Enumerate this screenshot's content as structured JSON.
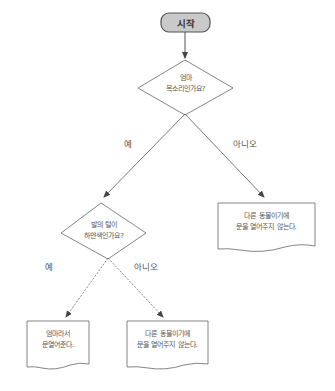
{
  "flowchart": {
    "start": {
      "label": "시작"
    },
    "decision1": {
      "line1": "엄마",
      "line2": "목소리인가요?"
    },
    "decision1_yes": "예",
    "decision1_no": "아니오",
    "outcome_no1": {
      "line1": "다른 동물이기에",
      "line2": "문을 열어주지 않는다."
    },
    "decision2": {
      "line1": "발의 털이",
      "line2": "하얀색인가요?"
    },
    "decision2_yes": "예",
    "decision2_no": "아니오",
    "outcome_yes2": {
      "line1": "엄마라서",
      "line2": "문열어준다."
    },
    "outcome_no2": {
      "line1": "다른 동물이기에",
      "line2": "문을 열어주지 않는다."
    }
  },
  "colors": {
    "start_fill": "#c9c9c9",
    "start_border": "#555555",
    "line": "#555555",
    "shape_border": "#666666"
  }
}
